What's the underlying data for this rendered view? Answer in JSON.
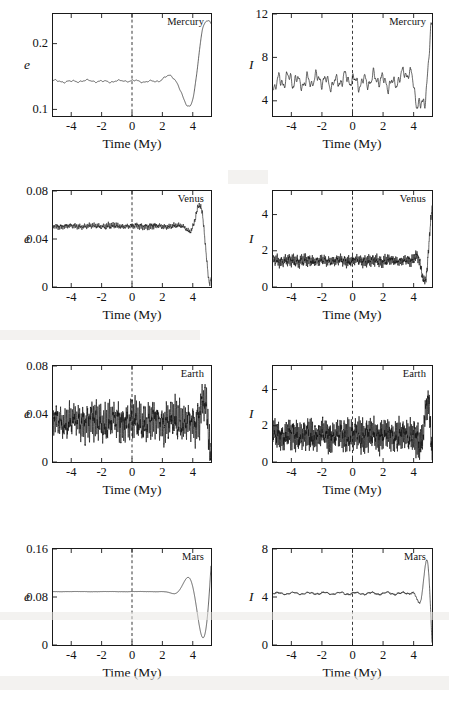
{
  "figure": {
    "xlabel": "Time (My)",
    "xticks": [
      "-4",
      "-2",
      "0",
      "2",
      "4"
    ],
    "xtick_values": [
      -4,
      -2,
      0,
      2,
      4
    ],
    "xlim": [
      -5.2,
      5.2
    ],
    "reference_line_x": 0,
    "ylabel_eccentricity": "e",
    "ylabel_inclination": "I",
    "line_color": "#111111",
    "frame_color": "#1a1a1a"
  },
  "chart_data": [
    {
      "type": "line",
      "title": "Mercury",
      "panel": "mercury-eccentricity",
      "column": "eccentricity",
      "xlabel": "Time (My)",
      "ylabel": "e",
      "xlim": [
        -5.2,
        5.2
      ],
      "ylim": [
        0.09,
        0.245
      ],
      "yticks": [
        0.1,
        0.2
      ],
      "ytick_labels": [
        "0.1",
        "0.2"
      ],
      "xticks": [
        -4,
        -2,
        0,
        2,
        4
      ],
      "xtick_labels": [
        "-4",
        "-2",
        "0",
        "2",
        "4"
      ],
      "grid": false,
      "legend": "none",
      "annotation": "Mercury",
      "series_mean": 0.175,
      "series_envelope": [
        0.105,
        0.235
      ],
      "noise_seed": 11,
      "components": [
        {
          "amplitude": 0.03,
          "period": 1.05,
          "phase": 0.35
        },
        {
          "amplitude": 0.016,
          "period": 0.42,
          "phase": 1.9
        },
        {
          "amplitude": 0.01,
          "period": 0.23,
          "phase": 0.6
        },
        {
          "amplitude": 0.013,
          "period": 2.6,
          "phase": 2.4
        }
      ],
      "n_points": 900,
      "jitter": 0.004
    },
    {
      "type": "line",
      "title": "Mercury",
      "panel": "mercury-inclination",
      "column": "inclination",
      "xlabel": "Time (My)",
      "ylabel": "I",
      "xlim": [
        -5.2,
        5.2
      ],
      "ylim": [
        2.6,
        12.0
      ],
      "yticks": [
        4,
        8,
        12
      ],
      "ytick_labels": [
        "4",
        "8",
        "12"
      ],
      "xticks": [
        -4,
        -2,
        0,
        2,
        4
      ],
      "xtick_labels": [
        "-4",
        "-2",
        "0",
        "2",
        "4"
      ],
      "grid": false,
      "legend": "none",
      "annotation": "Mercury",
      "series_mean": 7.3,
      "series_envelope": [
        3.3,
        11.2
      ],
      "noise_seed": 23,
      "components": [
        {
          "amplitude": 1.55,
          "period": 0.62,
          "phase": 0.2
        },
        {
          "amplitude": 1.05,
          "period": 0.27,
          "phase": 1.1
        },
        {
          "amplitude": 0.75,
          "period": 1.9,
          "phase": 2.8
        },
        {
          "amplitude": 0.55,
          "period": 0.15,
          "phase": 0.95
        }
      ],
      "n_points": 1100,
      "jitter": 0.35
    },
    {
      "type": "line",
      "title": "Venus",
      "panel": "venus-eccentricity",
      "column": "eccentricity",
      "xlabel": "Time (My)",
      "ylabel": "e",
      "xlim": [
        -5.2,
        5.2
      ],
      "ylim": [
        0.0,
        0.08
      ],
      "yticks": [
        0,
        0.04,
        0.08
      ],
      "ytick_labels": [
        "0",
        "0.04",
        "0.08"
      ],
      "xticks": [
        -4,
        -2,
        0,
        2,
        4
      ],
      "xtick_labels": [
        "-4",
        "-2",
        "0",
        "2",
        "4"
      ],
      "grid": false,
      "legend": "none",
      "annotation": "Venus",
      "series_mean": 0.029,
      "series_envelope": [
        0.001,
        0.07
      ],
      "noise_seed": 37,
      "components": [
        {
          "amplitude": 0.012,
          "period": 0.105,
          "phase": 0.4
        },
        {
          "amplitude": 0.009,
          "period": 0.052,
          "phase": 1.4
        },
        {
          "amplitude": 0.007,
          "period": 0.31,
          "phase": 2.1
        },
        {
          "amplitude": 0.005,
          "period": 1.4,
          "phase": 0.8
        }
      ],
      "n_points": 2600,
      "jitter": 0.006
    },
    {
      "type": "line",
      "title": "Venus",
      "panel": "venus-inclination",
      "column": "inclination",
      "xlabel": "Time (My)",
      "ylabel": "I",
      "xlim": [
        -5.2,
        5.2
      ],
      "ylim": [
        0.0,
        5.3
      ],
      "yticks": [
        0,
        2,
        4
      ],
      "ytick_labels": [
        "0",
        "2",
        "4"
      ],
      "xticks": [
        -4,
        -2,
        0,
        2,
        4
      ],
      "xtick_labels": [
        "-4",
        "-2",
        "0",
        "2",
        "4"
      ],
      "grid": false,
      "legend": "none",
      "annotation": "Venus",
      "series_mean": 2.0,
      "series_envelope": [
        0.15,
        4.5
      ],
      "noise_seed": 53,
      "components": [
        {
          "amplitude": 0.85,
          "period": 0.088,
          "phase": 0.9
        },
        {
          "amplitude": 0.6,
          "period": 0.041,
          "phase": 2.2
        },
        {
          "amplitude": 0.45,
          "period": 0.26,
          "phase": 1.3
        },
        {
          "amplitude": 0.3,
          "period": 1.1,
          "phase": 0.15
        }
      ],
      "n_points": 2800,
      "jitter": 0.42
    },
    {
      "type": "line",
      "title": "Earth",
      "panel": "earth-eccentricity",
      "column": "eccentricity",
      "xlabel": "Time (My)",
      "ylabel": "e",
      "xlim": [
        -5.2,
        5.2
      ],
      "ylim": [
        0.0,
        0.08
      ],
      "yticks": [
        0,
        0.04,
        0.08
      ],
      "ytick_labels": [
        "0",
        "0.04",
        "0.08"
      ],
      "xticks": [
        -4,
        -2,
        0,
        2,
        4
      ],
      "xtick_labels": [
        "-4",
        "-2",
        "0",
        "2",
        "4"
      ],
      "grid": false,
      "legend": "none",
      "annotation": "Earth",
      "series_mean": 0.027,
      "series_envelope": [
        0.001,
        0.065
      ],
      "noise_seed": 71,
      "components": [
        {
          "amplitude": 0.011,
          "period": 0.098,
          "phase": 1.7
        },
        {
          "amplitude": 0.008,
          "period": 0.048,
          "phase": 0.3
        },
        {
          "amplitude": 0.006,
          "period": 0.29,
          "phase": 2.6
        },
        {
          "amplitude": 0.004,
          "period": 1.3,
          "phase": 1.05
        }
      ],
      "n_points": 2600,
      "jitter": 0.006
    },
    {
      "type": "line",
      "title": "Earth",
      "panel": "earth-inclination",
      "column": "inclination",
      "xlabel": "Time (My)",
      "ylabel": "I",
      "xlim": [
        -5.2,
        5.2
      ],
      "ylim": [
        0.0,
        5.3
      ],
      "yticks": [
        0,
        2,
        4
      ],
      "ytick_labels": [
        "0",
        "2",
        "4"
      ],
      "xticks": [
        -4,
        -2,
        0,
        2,
        4
      ],
      "xtick_labels": [
        "-4",
        "-2",
        "0",
        "2",
        "4"
      ],
      "grid": false,
      "legend": "none",
      "annotation": "Earth",
      "series_mean": 1.95,
      "series_envelope": [
        0.1,
        3.95
      ],
      "noise_seed": 89,
      "components": [
        {
          "amplitude": 0.7,
          "period": 0.082,
          "phase": 0.55
        },
        {
          "amplitude": 0.52,
          "period": 0.039,
          "phase": 1.85
        },
        {
          "amplitude": 0.36,
          "period": 0.24,
          "phase": 2.9
        },
        {
          "amplitude": 0.22,
          "period": 1.05,
          "phase": 0.7
        }
      ],
      "n_points": 2800,
      "jitter": 0.38
    },
    {
      "type": "line",
      "title": "Mars",
      "panel": "mars-eccentricity",
      "column": "eccentricity",
      "xlabel": "Time (My)",
      "ylabel": "e",
      "xlim": [
        -5.2,
        5.2
      ],
      "ylim": [
        0.0,
        0.16
      ],
      "yticks": [
        0,
        0.08,
        0.16
      ],
      "ytick_labels": [
        "0",
        "0.08",
        "0.16"
      ],
      "xticks": [
        -4,
        -2,
        0,
        2,
        4
      ],
      "xtick_labels": [
        "-4",
        "-2",
        "0",
        "2",
        "4"
      ],
      "grid": false,
      "legend": "none",
      "annotation": "Mars",
      "series_mean": 0.08,
      "series_envelope": [
        0.012,
        0.132
      ],
      "noise_seed": 101,
      "components": [
        {
          "amplitude": 0.028,
          "period": 2.05,
          "phase": 0.1
        },
        {
          "amplitude": 0.012,
          "period": 0.62,
          "phase": 1.6
        },
        {
          "amplitude": 0.009,
          "period": 0.115,
          "phase": 2.35
        },
        {
          "amplitude": 0.006,
          "period": 0.055,
          "phase": 0.45
        }
      ],
      "n_points": 2200,
      "jitter": 0.006
    },
    {
      "type": "line",
      "title": "Mars",
      "panel": "mars-inclination",
      "column": "inclination",
      "xlabel": "Time (My)",
      "ylabel": "I",
      "xlim": [
        -5.2,
        5.2
      ],
      "ylim": [
        0.0,
        8.0
      ],
      "yticks": [
        0,
        4,
        8
      ],
      "ytick_labels": [
        "0",
        "4",
        "8"
      ],
      "xticks": [
        -4,
        -2,
        0,
        2,
        4
      ],
      "xtick_labels": [
        "-4",
        "-2",
        "0",
        "2",
        "4"
      ],
      "grid": false,
      "legend": "none",
      "annotation": "Mars",
      "series_mean": 3.7,
      "series_envelope": [
        0.2,
        7.1
      ],
      "noise_seed": 127,
      "components": [
        {
          "amplitude": 1.55,
          "period": 1.02,
          "phase": 0.25
        },
        {
          "amplitude": 0.75,
          "period": 0.33,
          "phase": 1.45
        },
        {
          "amplitude": 0.55,
          "period": 0.095,
          "phase": 2.7
        },
        {
          "amplitude": 0.4,
          "period": 0.048,
          "phase": 0.85
        }
      ],
      "n_points": 2400,
      "jitter": 0.42
    }
  ],
  "layout": {
    "panels": [
      {
        "key": "mercury-eccentricity",
        "frame": {
          "x": 52,
          "y": 13,
          "w": 160,
          "h": 104
        },
        "ylabel_pos": {
          "x": 24,
          "y": 58
        },
        "xlabel_pos": {
          "x": 132,
          "y": 137
        },
        "title_pos": {
          "x": 204,
          "y": 16,
          "align": "right"
        },
        "ytick_label_x": 48,
        "xtick_label_y": 120
      },
      {
        "key": "mercury-inclination",
        "frame": {
          "x": 272,
          "y": 13,
          "w": 161,
          "h": 104
        },
        "ylabel_pos": {
          "x": 249,
          "y": 58
        },
        "xlabel_pos": {
          "x": 352,
          "y": 137
        },
        "title_pos": {
          "x": 426,
          "y": 16,
          "align": "right"
        },
        "ytick_label_x": 268,
        "xtick_label_y": 120
      },
      {
        "key": "venus-eccentricity",
        "frame": {
          "x": 52,
          "y": 190,
          "w": 160,
          "h": 98
        },
        "ylabel_pos": {
          "x": 24,
          "y": 232
        },
        "xlabel_pos": {
          "x": 132,
          "y": 308
        },
        "title_pos": {
          "x": 204,
          "y": 193,
          "align": "right"
        },
        "ytick_label_x": 48,
        "xtick_label_y": 291
      },
      {
        "key": "venus-inclination",
        "frame": {
          "x": 272,
          "y": 190,
          "w": 161,
          "h": 98
        },
        "ylabel_pos": {
          "x": 249,
          "y": 232
        },
        "xlabel_pos": {
          "x": 352,
          "y": 308
        },
        "title_pos": {
          "x": 426,
          "y": 193,
          "align": "right"
        },
        "ytick_label_x": 268,
        "xtick_label_y": 291
      },
      {
        "key": "earth-eccentricity",
        "frame": {
          "x": 52,
          "y": 365,
          "w": 160,
          "h": 98
        },
        "ylabel_pos": {
          "x": 24,
          "y": 407
        },
        "xlabel_pos": {
          "x": 132,
          "y": 483
        },
        "title_pos": {
          "x": 204,
          "y": 368,
          "align": "right"
        },
        "ytick_label_x": 48,
        "xtick_label_y": 466
      },
      {
        "key": "earth-inclination",
        "frame": {
          "x": 272,
          "y": 365,
          "w": 161,
          "h": 98
        },
        "ylabel_pos": {
          "x": 249,
          "y": 407
        },
        "xlabel_pos": {
          "x": 352,
          "y": 483
        },
        "title_pos": {
          "x": 426,
          "y": 368,
          "align": "right"
        },
        "ytick_label_x": 268,
        "xtick_label_y": 466
      },
      {
        "key": "mars-eccentricity",
        "frame": {
          "x": 52,
          "y": 548,
          "w": 160,
          "h": 98
        },
        "ylabel_pos": {
          "x": 24,
          "y": 590
        },
        "xlabel_pos": {
          "x": 132,
          "y": 666
        },
        "title_pos": {
          "x": 204,
          "y": 551,
          "align": "right"
        },
        "ytick_label_x": 48,
        "xtick_label_y": 649
      },
      {
        "key": "mars-inclination",
        "frame": {
          "x": 272,
          "y": 548,
          "w": 161,
          "h": 98
        },
        "ylabel_pos": {
          "x": 249,
          "y": 590
        },
        "xlabel_pos": {
          "x": 352,
          "y": 666
        },
        "title_pos": {
          "x": 426,
          "y": 551,
          "align": "right"
        },
        "ytick_label_x": 268,
        "xtick_label_y": 649
      }
    ]
  }
}
